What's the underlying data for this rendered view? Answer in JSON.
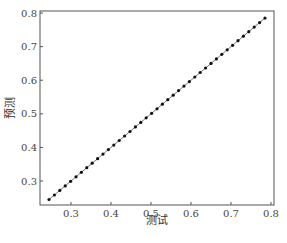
{
  "chart_data": {
    "type": "scatter",
    "title": "",
    "xlabel": "测试",
    "ylabel": "预测",
    "xlim": [
      0.2225,
      0.8075
    ],
    "ylim": [
      0.2286,
      0.806
    ],
    "x_ticks": [
      0.3,
      0.4,
      0.5,
      0.6,
      0.7,
      0.8
    ],
    "x_tick_labels": [
      "0.3",
      "0.4",
      "0.5",
      "0.6",
      "0.7",
      "0.8"
    ],
    "y_ticks": [
      0.3,
      0.4,
      0.5,
      0.6,
      0.7,
      0.8
    ],
    "y_tick_labels": [
      "0.3",
      "0.4",
      "0.5",
      "0.6",
      "0.7",
      "0.8"
    ],
    "grid": false,
    "legend": null,
    "series": [
      {
        "name": "预测 vs 测试",
        "marker": "circle",
        "color": "#111111",
        "line": true,
        "line_color": "#555555",
        "x_start": 0.245,
        "x_end": 0.785,
        "count": 41,
        "relation": "y = x"
      }
    ]
  },
  "colors": {
    "axis": "#555555",
    "marker": "#111111",
    "line": "#666666",
    "background": "#ffffff"
  }
}
